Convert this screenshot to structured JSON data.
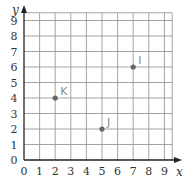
{
  "chart_data": {
    "type": "scatter",
    "title": "",
    "xlabel": "x",
    "ylabel": "y",
    "xlim": [
      0,
      9
    ],
    "ylim": [
      0,
      9
    ],
    "grid": true,
    "x_ticks": [
      "0",
      "1",
      "2",
      "3",
      "4",
      "5",
      "6",
      "7",
      "8",
      "9"
    ],
    "y_ticks": [
      "0",
      "1",
      "2",
      "3",
      "4",
      "5",
      "6",
      "7",
      "8",
      "9"
    ],
    "points": [
      {
        "label": "K",
        "x": 2,
        "y": 4
      },
      {
        "label": "J",
        "x": 5,
        "y": 2
      },
      {
        "label": "I",
        "x": 7,
        "y": 6
      }
    ],
    "colors": {
      "grid": "#9a9a9a",
      "axis": "#222222",
      "point": "#666666",
      "point_label": "#8a8a8a"
    }
  }
}
